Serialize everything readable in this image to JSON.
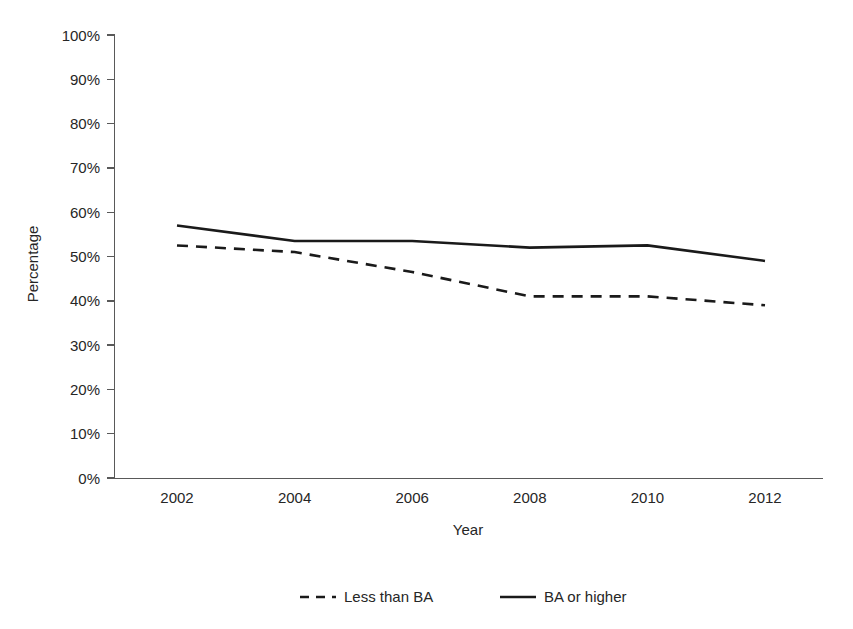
{
  "chart_data": {
    "type": "line",
    "title": "",
    "xlabel": "Year",
    "ylabel": "Percentage",
    "x": [
      2002,
      2004,
      2006,
      2008,
      2010,
      2012
    ],
    "xtick_labels": [
      "2002",
      "2004",
      "2006",
      "2008",
      "2010",
      "2012"
    ],
    "ytick_labels": [
      "0%",
      "10%",
      "20%",
      "30%",
      "40%",
      "50%",
      "60%",
      "70%",
      "80%",
      "90%",
      "100%"
    ],
    "ytick_values": [
      0,
      10,
      20,
      30,
      40,
      50,
      60,
      70,
      80,
      90,
      100
    ],
    "ylim": [
      0,
      100
    ],
    "xlim": [
      2002,
      2012
    ],
    "grid": false,
    "legend_position": "bottom",
    "series": [
      {
        "name": "Less than BA",
        "style": "dashed",
        "color": "#1a1a1a",
        "values": [
          52.5,
          51.0,
          46.5,
          41.0,
          41.0,
          39.0
        ]
      },
      {
        "name": "BA or higher",
        "style": "solid",
        "color": "#1a1a1a",
        "values": [
          57.0,
          53.5,
          53.5,
          52.0,
          52.5,
          49.0
        ]
      }
    ]
  },
  "legend": {
    "entries": [
      {
        "label": "Less than BA",
        "style": "dashed"
      },
      {
        "label": "BA or higher",
        "style": "solid"
      }
    ]
  },
  "axes": {
    "x_title": "Year",
    "y_title": "Percentage"
  },
  "colors": {
    "series": "#1a1a1a",
    "axis": "#595959",
    "text": "#262626",
    "background": "#ffffff"
  }
}
